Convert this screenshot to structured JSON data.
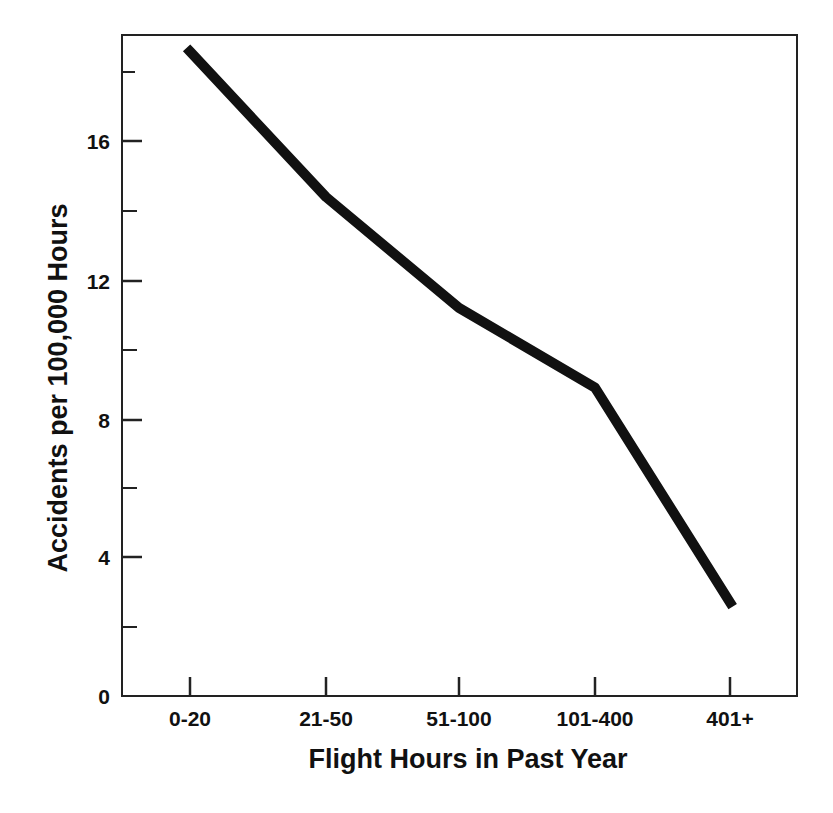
{
  "chart_data": {
    "type": "line",
    "title": "",
    "xlabel": "Flight Hours in Past Year",
    "ylabel": "Accidents per 100,000 Hours",
    "categories": [
      "0-20",
      "21-50",
      "51-100",
      "101-400",
      "401+"
    ],
    "series": [
      {
        "name": "Accident rate",
        "values": [
          18.6,
          14.4,
          11.2,
          8.9,
          2.7
        ],
        "color": "#111111"
      }
    ],
    "ylim": [
      0,
      18.7
    ],
    "y_ticks_major": [
      0,
      4,
      8,
      12,
      16
    ],
    "y_ticks_minor": [
      2,
      6,
      10,
      14,
      18
    ],
    "grid": false,
    "legend": "none"
  },
  "axes": {
    "x_title": "Flight Hours in Past Year",
    "y_title": "Accidents per 100,000 Hours",
    "y_tick_labels": [
      "0",
      "4",
      "8",
      "12",
      "16"
    ],
    "x_tick_labels": [
      "0-20",
      "21-50",
      "51-100",
      "101-400",
      "401+"
    ]
  },
  "colors": {
    "line": "#111111",
    "frame": "#222222",
    "background": "#ffffff"
  }
}
